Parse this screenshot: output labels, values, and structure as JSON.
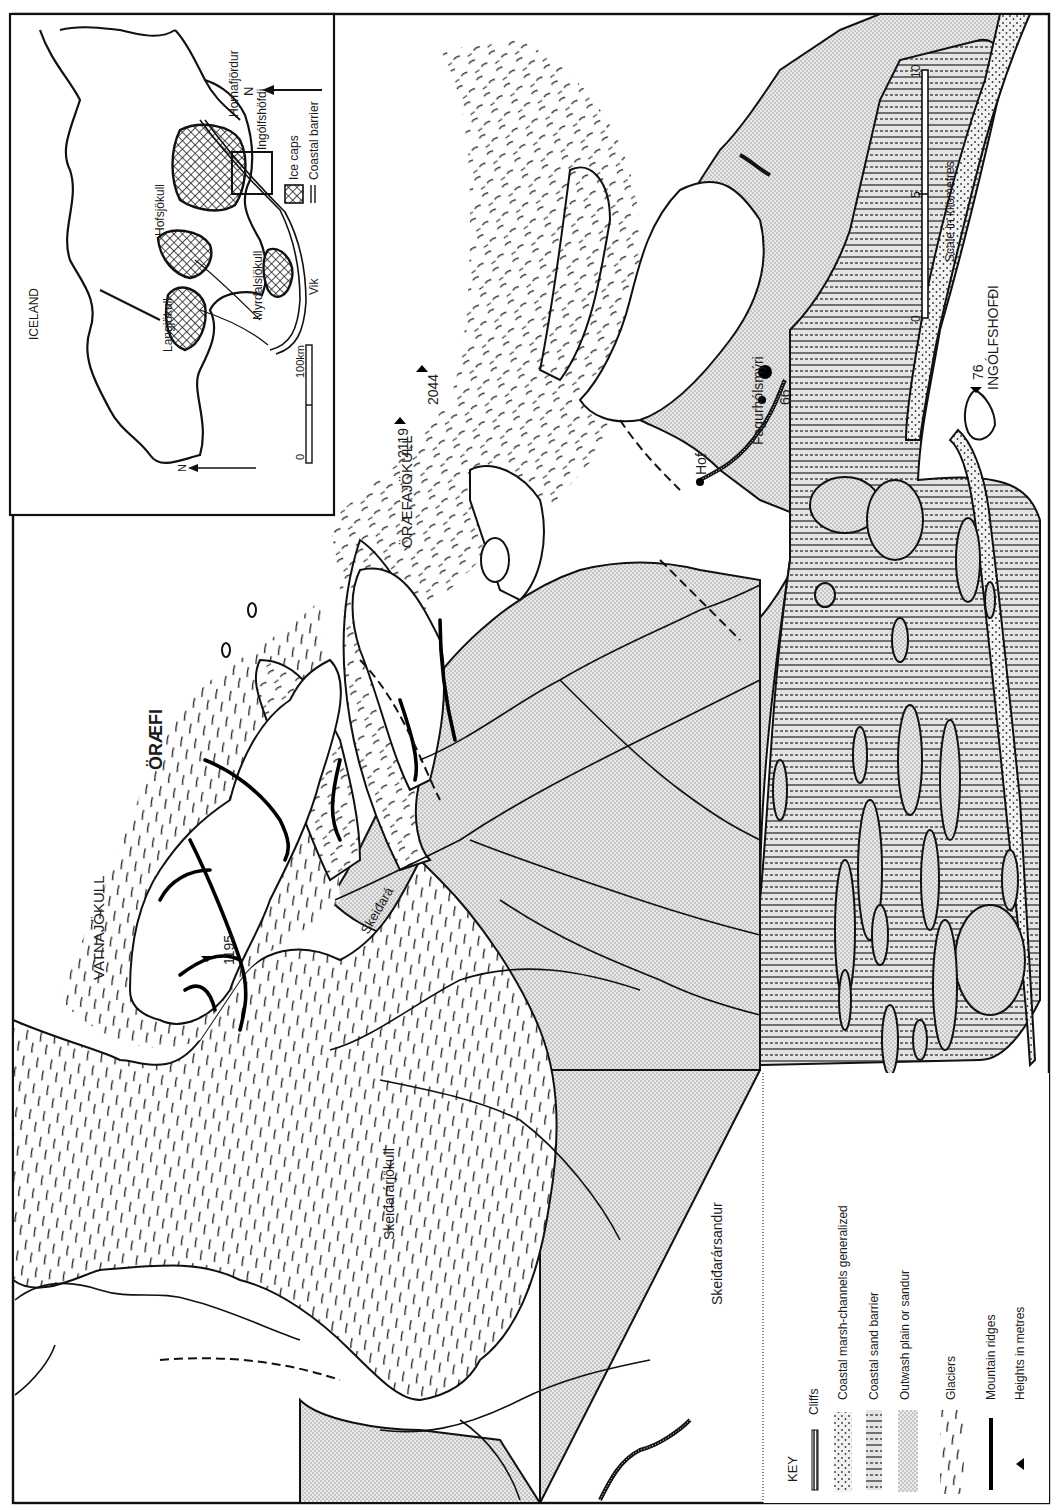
{
  "map": {
    "region_label": "ÖRÆFI",
    "places": {
      "vatnajokull": "VATNAJÖKULL",
      "oraefajokull": "ÖRÆFAJÖKULL",
      "skeidararjokull": "Skeiđarárjökull",
      "skeidararsandur": "Skeiđarársandur",
      "skeidara": "Skeiđará",
      "hof": "Hof",
      "fagurholsmyri": "Fagurhólsmýri",
      "ingolfshofdi": "INGÓLFSHOFĐI"
    },
    "heights": {
      "h2119": "2119",
      "h2044": "2044",
      "h1195": "1195",
      "h66": "66",
      "h76": "76"
    },
    "north_arrow": "N",
    "scale": {
      "title": "Scale in kilometres",
      "ticks": [
        "0",
        "5",
        "10"
      ]
    }
  },
  "inset": {
    "title": "ICELAND",
    "north_arrow": "N",
    "places": {
      "langjokull": "Langjökull",
      "hofsjokull": "Hofsjökull",
      "myrdalsjokull": "Myrdalsjökull",
      "vik": "Vik",
      "ingolfshofdi": "Ingólfshöfdi",
      "hornafjordur": "Hornafjördur"
    },
    "scale": {
      "zero": "0",
      "label": "100km"
    },
    "legend": [
      {
        "label": "Ice caps",
        "symbol": "crosshatch"
      },
      {
        "label": "Coastal barrier",
        "symbol": "double-line"
      }
    ]
  },
  "key": {
    "title": "KEY",
    "items": [
      {
        "label": "Cliffs",
        "symbol": "hatched-line"
      },
      {
        "label": "Coastal marsh-channels generalized",
        "symbol": "dots"
      },
      {
        "label": "Coastal sand barrier",
        "symbol": "dashes"
      },
      {
        "label": "Outwash plain or sandur",
        "symbol": "fine-stipple"
      },
      {
        "label": "Glaciers",
        "symbol": "glacier-strokes"
      },
      {
        "label": "Mountain ridges",
        "symbol": "thick-line"
      },
      {
        "label": "Heights in metres",
        "symbol": "triangle"
      }
    ]
  }
}
